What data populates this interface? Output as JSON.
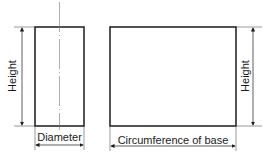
{
  "diagram": {
    "labels": {
      "left_height": "Height",
      "diameter": "Diameter",
      "right_height": "Height",
      "circumference": "Circumference of base"
    },
    "colors": {
      "stroke": "#1a1a1a",
      "background": "#ffffff",
      "thin": "#555555"
    }
  }
}
